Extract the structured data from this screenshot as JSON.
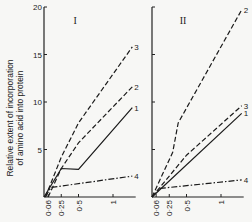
{
  "chart_data": [
    {
      "type": "line",
      "title": "I",
      "ylabel": "Relative extent of incorporation of amino acid into protein",
      "xlabel": "",
      "xlim": [
        0,
        1.3
      ],
      "ylim": [
        0,
        20
      ],
      "xticks": [
        0.06,
        0.25,
        0.5,
        1
      ],
      "xtick_labels": [
        "0·06",
        "0·25",
        "0·5",
        "1"
      ],
      "yticks": [
        5,
        10,
        15,
        20
      ],
      "ytick_labels": [
        "5",
        "10",
        "15",
        "20"
      ],
      "grid": false,
      "series": [
        {
          "name": "1",
          "style": "solid",
          "points": [
            [
              0,
              0
            ],
            [
              0.25,
              3.0
            ],
            [
              0.5,
              2.9
            ],
            [
              1.28,
              9.4
            ]
          ]
        },
        {
          "name": "2",
          "style": "dashed",
          "points": [
            [
              0.06,
              0
            ],
            [
              0.25,
              3.0
            ],
            [
              0.5,
              5.7
            ],
            [
              1.28,
              11.6
            ]
          ]
        },
        {
          "name": "3",
          "style": "dashed",
          "points": [
            [
              0.02,
              0
            ],
            [
              0.25,
              4.2
            ],
            [
              0.5,
              7.8
            ],
            [
              1.28,
              15.8
            ]
          ]
        },
        {
          "name": "4",
          "style": "dashdot",
          "points": [
            [
              0.02,
              0
            ],
            [
              0.1,
              1.0
            ],
            [
              1.28,
              2.2
            ]
          ]
        }
      ]
    },
    {
      "type": "line",
      "title": "II",
      "ylabel": "",
      "xlabel": "",
      "xlim": [
        0,
        1.3
      ],
      "ylim": [
        0,
        20
      ],
      "xticks": [
        0.06,
        0.25,
        0.5,
        1
      ],
      "xtick_labels": [
        "0·06",
        "0·25",
        "0·5",
        "1"
      ],
      "yticks": [
        5,
        10,
        15,
        20
      ],
      "ytick_labels": [
        "",
        "",
        "",
        ""
      ],
      "grid": false,
      "series": [
        {
          "name": "1",
          "style": "solid",
          "points": [
            [
              0,
              0
            ],
            [
              1.3,
              8.8
            ]
          ]
        },
        {
          "name": "2",
          "style": "dashed",
          "points": [
            [
              0,
              0
            ],
            [
              0.3,
              4.7
            ],
            [
              0.38,
              7.8
            ],
            [
              1.3,
              19.7
            ]
          ]
        },
        {
          "name": "3",
          "style": "dashed",
          "points": [
            [
              0,
              0
            ],
            [
              0.5,
              4.4
            ],
            [
              1.3,
              9.6
            ]
          ]
        },
        {
          "name": "4",
          "style": "dashdot",
          "points": [
            [
              0,
              0
            ],
            [
              0.12,
              0.9
            ],
            [
              1.3,
              1.8
            ]
          ]
        }
      ]
    }
  ]
}
